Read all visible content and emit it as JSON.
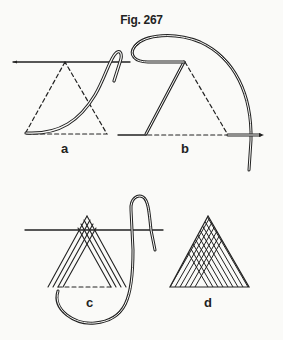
{
  "figure": {
    "title": "Fig. 267",
    "panels": [
      {
        "label": "a",
        "description": "First stitch: thread brought across triangle, dashed guide outline"
      },
      {
        "label": "b",
        "description": "Second stitch: needle along top line, thread looped around to right"
      },
      {
        "label": "c",
        "description": "Stitches built up along both sides of triangle"
      },
      {
        "label": "d",
        "description": "Completed triangle filled with diagonal stitches"
      }
    ]
  },
  "colors": {
    "ink": "#222222",
    "paper": "#fafaf8"
  }
}
